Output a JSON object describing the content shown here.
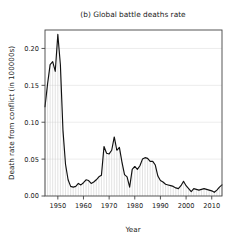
{
  "chart_data": {
    "type": "area",
    "title": "(b) Global battle deaths rate",
    "xlabel": "Year",
    "ylabel": "Death rate from conflict (in 100000s)",
    "xlim": [
      1945,
      2014
    ],
    "ylim": [
      0.0,
      0.225
    ],
    "grid": true,
    "grid_axis": "y",
    "legend": null,
    "legend_position": "none",
    "fill_style": "vertical-hatch",
    "fill_color": "#c9c9c9",
    "line_color": "#111111",
    "xticks": [
      1950,
      1960,
      1970,
      1980,
      1990,
      2000,
      2010
    ],
    "xtick_labels": [
      "1950",
      "1960",
      "1970",
      "1980",
      "1990",
      "2000",
      "2010"
    ],
    "yticks": [
      0.0,
      0.05,
      0.1,
      0.15,
      0.2
    ],
    "ytick_labels": [
      "0.00",
      "0.05",
      "0.10",
      "0.15",
      "0.20"
    ],
    "x": [
      1945,
      1946,
      1947,
      1948,
      1949,
      1950,
      1951,
      1952,
      1953,
      1954,
      1955,
      1956,
      1957,
      1958,
      1959,
      1960,
      1961,
      1962,
      1963,
      1964,
      1965,
      1966,
      1967,
      1968,
      1969,
      1970,
      1971,
      1972,
      1973,
      1974,
      1975,
      1976,
      1977,
      1978,
      1979,
      1980,
      1981,
      1982,
      1983,
      1984,
      1985,
      1986,
      1987,
      1988,
      1989,
      1990,
      1991,
      1992,
      1993,
      1994,
      1995,
      1996,
      1997,
      1998,
      1999,
      2000,
      2001,
      2002,
      2003,
      2004,
      2005,
      2006,
      2007,
      2008,
      2009,
      2010,
      2011,
      2012,
      2013,
      2014
    ],
    "values": [
      0.121,
      0.152,
      0.178,
      0.182,
      0.169,
      0.219,
      0.178,
      0.089,
      0.043,
      0.022,
      0.013,
      0.012,
      0.013,
      0.017,
      0.015,
      0.018,
      0.022,
      0.021,
      0.017,
      0.019,
      0.022,
      0.026,
      0.028,
      0.067,
      0.058,
      0.057,
      0.062,
      0.08,
      0.062,
      0.066,
      0.046,
      0.029,
      0.026,
      0.012,
      0.036,
      0.04,
      0.036,
      0.041,
      0.05,
      0.052,
      0.051,
      0.047,
      0.047,
      0.042,
      0.027,
      0.021,
      0.019,
      0.016,
      0.015,
      0.014,
      0.013,
      0.011,
      0.01,
      0.014,
      0.02,
      0.014,
      0.01,
      0.006,
      0.01,
      0.009,
      0.008,
      0.009,
      0.01,
      0.009,
      0.008,
      0.007,
      0.005,
      0.008,
      0.012,
      0.015
    ],
    "series": [
      {
        "name": "Global battle deaths rate",
        "values": [
          0.121,
          0.152,
          0.178,
          0.182,
          0.169,
          0.219,
          0.178,
          0.089,
          0.043,
          0.022,
          0.013,
          0.012,
          0.013,
          0.017,
          0.015,
          0.018,
          0.022,
          0.021,
          0.017,
          0.019,
          0.022,
          0.026,
          0.028,
          0.067,
          0.058,
          0.057,
          0.062,
          0.08,
          0.062,
          0.066,
          0.046,
          0.029,
          0.026,
          0.012,
          0.036,
          0.04,
          0.036,
          0.041,
          0.05,
          0.052,
          0.051,
          0.047,
          0.047,
          0.042,
          0.027,
          0.021,
          0.019,
          0.016,
          0.015,
          0.014,
          0.013,
          0.011,
          0.01,
          0.014,
          0.02,
          0.014,
          0.01,
          0.006,
          0.01,
          0.009,
          0.008,
          0.009,
          0.01,
          0.009,
          0.008,
          0.007,
          0.005,
          0.008,
          0.012,
          0.015
        ]
      }
    ]
  },
  "plot_geometry": {
    "left": 45,
    "right": 222,
    "top": 30,
    "bottom": 196
  }
}
